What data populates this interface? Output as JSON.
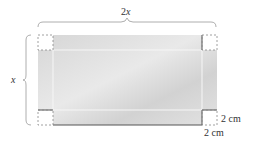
{
  "diagram": {
    "top_label": {
      "coef": "2",
      "var": "x"
    },
    "left_label": {
      "var": "x"
    },
    "corner_height_label": "2 cm",
    "corner_width_label": "2 cm",
    "colors": {
      "sheet": "#dcdcdc",
      "dash": "#888888",
      "edge": "#555555",
      "brace": "#999999",
      "fold": "#f4f4f4"
    }
  }
}
